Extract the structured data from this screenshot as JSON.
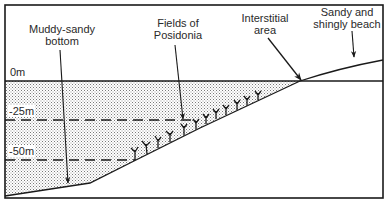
{
  "figure": {
    "title_clipped": "",
    "labels": {
      "muddy_sandy": "Muddy-sandy\nbottom",
      "muddy_sandy_line1": "Muddy-sandy",
      "muddy_sandy_line2": "bottom",
      "posidonia_line1": "Fields of",
      "posidonia_line2": "Posidonia",
      "interstitial_line1": "Interstitial",
      "interstitial_line2": "area",
      "beach_line1": "Sandy and",
      "beach_line2": "shingly beach"
    },
    "depths": {
      "d0": "0m",
      "d25": "-25m",
      "d50": "-50m"
    },
    "colors": {
      "ink": "#1a1a1a",
      "stipple": "#9a9a9a",
      "background": "#ffffff"
    }
  }
}
